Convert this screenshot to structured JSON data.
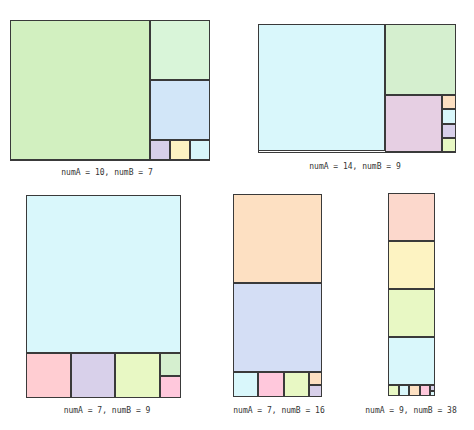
{
  "colors": {
    "green": "#d2f0c0",
    "mint": "#d9f5d9",
    "blue": "#d2e6f8",
    "lavender": "#d8d0ea",
    "yellow": "#fdf3c2",
    "cyan": "#d9f7fb",
    "green2": "#d5efcf",
    "pink": "#e6cfe3",
    "orange": "#fde0c2",
    "rose": "#ffcdd2",
    "lime": "#e8f8c4",
    "salmon": "#fcd8cc",
    "cornflower": "#d4def5",
    "pinkbright": "#ffc8dc"
  },
  "figures": [
    {
      "label": "numA = 10, numB = 7",
      "box": [
        10,
        20,
        200,
        141
      ],
      "label_pos": [
        107,
        168
      ],
      "squares": [
        {
          "x": 10,
          "y": 20,
          "s": 140,
          "c": "green"
        },
        {
          "x": 150,
          "y": 20,
          "s": 60,
          "c": "mint"
        },
        {
          "x": 150,
          "y": 80,
          "s": 60,
          "c": "blue"
        },
        {
          "x": 150,
          "y": 140,
          "s": 20,
          "c": "lavender"
        },
        {
          "x": 170,
          "y": 140,
          "s": 20,
          "c": "yellow"
        },
        {
          "x": 190,
          "y": 140,
          "s": 20,
          "c": "cyan"
        }
      ]
    },
    {
      "label": "numA = 14, numB = 9",
      "box": [
        258,
        24,
        198,
        129
      ],
      "label_pos": [
        355,
        162
      ],
      "squares": [
        {
          "x": 258,
          "y": 24,
          "s": 127,
          "c": "cyan"
        },
        {
          "x": 385,
          "y": 24,
          "s": 71,
          "c": "green2"
        },
        {
          "x": 385,
          "y": 95,
          "s": 57,
          "c": "pink"
        },
        {
          "x": 442,
          "y": 95,
          "s": 14.25,
          "c": "orange"
        },
        {
          "x": 442,
          "y": 109.25,
          "s": 14.25,
          "c": "cyan"
        },
        {
          "x": 442,
          "y": 123.5,
          "s": 14.25,
          "c": "lavender"
        },
        {
          "x": 442,
          "y": 137.75,
          "s": 14.25,
          "c": "lime"
        }
      ]
    },
    {
      "label": "numA = 7, numB = 9",
      "box": [
        26,
        195,
        155,
        203
      ],
      "label_pos": [
        107,
        406
      ],
      "squares": [
        {
          "x": 26,
          "y": 195,
          "s": 155,
          "c": "cyan",
          "h": 158
        },
        {
          "x": 26,
          "y": 353,
          "s": 44.5,
          "c": "rose"
        },
        {
          "x": 70.5,
          "y": 353,
          "s": 44.5,
          "c": "lavender"
        },
        {
          "x": 115,
          "y": 353,
          "s": 44.5,
          "c": "lime"
        },
        {
          "x": 159.5,
          "y": 353,
          "s": 21.5,
          "c": "green2",
          "h": 22.5
        },
        {
          "x": 159.5,
          "y": 375.5,
          "s": 21.5,
          "c": "pinkbright",
          "h": 22.5
        }
      ]
    },
    {
      "label": "numA = 7, numB = 16",
      "box": [
        233,
        194,
        89,
        203
      ],
      "label_pos": [
        279,
        406
      ],
      "squares": [
        {
          "x": 233,
          "y": 194,
          "s": 89,
          "c": "orange"
        },
        {
          "x": 233,
          "y": 283,
          "s": 89,
          "c": "cornflower"
        },
        {
          "x": 233,
          "y": 372,
          "s": 25.4,
          "c": "cyan",
          "h": 25
        },
        {
          "x": 258.4,
          "y": 372,
          "s": 25.4,
          "c": "pinkbright",
          "h": 25
        },
        {
          "x": 283.8,
          "y": 372,
          "s": 25.4,
          "c": "lime",
          "h": 25
        },
        {
          "x": 309.2,
          "y": 372,
          "s": 12.8,
          "c": "orange",
          "h": 12.5
        },
        {
          "x": 309.2,
          "y": 384.5,
          "s": 12.8,
          "c": "lavender",
          "h": 12.5
        }
      ]
    },
    {
      "label": "numA = 9, numB = 38",
      "box": [
        388,
        193,
        47,
        203
      ],
      "label_pos": [
        411,
        406
      ],
      "squares": [
        {
          "x": 388,
          "y": 193,
          "s": 47,
          "c": "salmon",
          "h": 48
        },
        {
          "x": 388,
          "y": 241,
          "s": 47,
          "c": "yellow",
          "h": 48
        },
        {
          "x": 388,
          "y": 289,
          "s": 47,
          "c": "lime",
          "h": 48
        },
        {
          "x": 388,
          "y": 337,
          "s": 47,
          "c": "cyan",
          "h": 48
        },
        {
          "x": 388,
          "y": 385,
          "s": 10.5,
          "c": "lime",
          "h": 11
        },
        {
          "x": 398.5,
          "y": 385,
          "s": 10.5,
          "c": "cyan",
          "h": 11
        },
        {
          "x": 409,
          "y": 385,
          "s": 10.5,
          "c": "orange",
          "h": 11
        },
        {
          "x": 419.5,
          "y": 385,
          "s": 10.5,
          "c": "pinkbright",
          "h": 11
        },
        {
          "x": 430,
          "y": 385,
          "s": 5,
          "c": "lavender",
          "h": 5.5
        },
        {
          "x": 430,
          "y": 390.5,
          "s": 5,
          "c": "cyan",
          "h": 5.5
        }
      ]
    }
  ]
}
